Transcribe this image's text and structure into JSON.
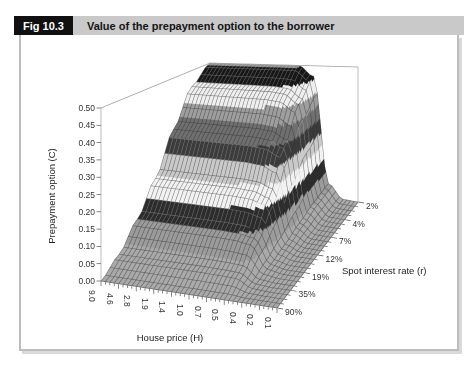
{
  "header": {
    "fig_label": "Fig 10.3",
    "title": "Value of the prepayment option to the borrower"
  },
  "chart_data": {
    "type": "surface3d",
    "x_axis": {
      "label": "House price (H)",
      "categories": [
        "9.0",
        "4.6",
        "2.8",
        "1.9",
        "1.4",
        "1.0",
        "0.7",
        "0.5",
        "0.4",
        "0.2",
        "0.1"
      ]
    },
    "depth_axis": {
      "label": "Spot interest rate (r)",
      "categories": [
        "2%",
        "4%",
        "7%",
        "12%",
        "19%",
        "35%",
        "90%"
      ]
    },
    "value_axis": {
      "label": "Prepayment option (C)",
      "min": 0,
      "max": 0.5,
      "step": 0.05,
      "tick_labels": [
        "0.00",
        "0.05",
        "0.10",
        "0.15",
        "0.20",
        "0.25",
        "0.30",
        "0.35",
        "0.40",
        "0.45",
        "0.50"
      ]
    },
    "series": [
      {
        "name": "2%",
        "values": [
          0.5,
          0.5,
          0.5,
          0.5,
          0.5,
          0.5,
          0.5,
          0.46,
          0.06,
          0.005,
          0
        ]
      },
      {
        "name": "4%",
        "values": [
          0.44,
          0.44,
          0.44,
          0.44,
          0.44,
          0.44,
          0.435,
          0.4,
          0.053,
          0.004,
          0
        ]
      },
      {
        "name": "7%",
        "values": [
          0.32,
          0.32,
          0.32,
          0.32,
          0.32,
          0.32,
          0.315,
          0.29,
          0.038,
          0.003,
          0
        ]
      },
      {
        "name": "12%",
        "values": [
          0.19,
          0.19,
          0.19,
          0.19,
          0.19,
          0.19,
          0.187,
          0.17,
          0.023,
          0.002,
          0
        ]
      },
      {
        "name": "19%",
        "values": [
          0.1,
          0.1,
          0.1,
          0.1,
          0.1,
          0.1,
          0.098,
          0.09,
          0.012,
          0.001,
          0
        ]
      },
      {
        "name": "35%",
        "values": [
          0.035,
          0.035,
          0.035,
          0.035,
          0.035,
          0.035,
          0.034,
          0.032,
          0.004,
          0,
          0
        ]
      },
      {
        "name": "90%",
        "values": [
          0,
          0,
          0,
          0,
          0,
          0,
          0,
          0,
          0,
          0,
          0
        ]
      }
    ],
    "band_colors": [
      "#a9a9a9",
      "#9b9b9b",
      "#2b2b2b",
      "#f2f2f2",
      "#c9c9c9",
      "#3a3a3a",
      "#6e6e6e",
      "#9d9d9d",
      "#efefef",
      "#151515",
      "#8f8f8f"
    ],
    "mesh_dark": "rgba(45,45,45,0.55)",
    "mesh_light": "rgba(215,215,215,0.35)",
    "wall_line_color": "#a0a0a0",
    "axis_line_color": "#555555"
  }
}
